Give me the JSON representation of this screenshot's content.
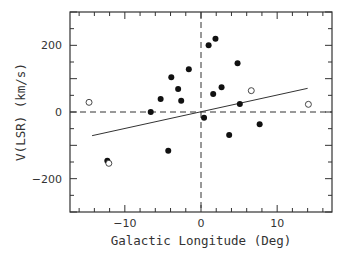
{
  "chart_data": {
    "type": "scatter",
    "title": "",
    "xlabel": "Galactic Longitude (Deg)",
    "ylabel": "V(LSR) (km/s)",
    "xlim": [
      -17.2,
      17.2
    ],
    "ylim": [
      -300,
      300
    ],
    "xticks_major": [
      -10,
      0,
      10
    ],
    "xtick_labels": [
      "−10",
      "0",
      "10"
    ],
    "xticks_minor_step": 2,
    "yticks_major": [
      -200,
      0,
      200
    ],
    "ytick_labels": [
      "−200",
      "0",
      "200"
    ],
    "yticks_minor_step": 50,
    "grid": false,
    "reference_lines": [
      {
        "orientation": "horizontal",
        "value": 0,
        "style": "dashed"
      },
      {
        "orientation": "vertical",
        "value": 0,
        "style": "dashed"
      }
    ],
    "series": [
      {
        "name": "filled",
        "marker": "filled-circle",
        "x": [
          1.0,
          1.9,
          4.8,
          -1.6,
          -3.9,
          -3.0,
          -5.3,
          -2.6,
          -6.6,
          1.6,
          2.7,
          5.1,
          0.4,
          7.7,
          3.7,
          -4.3,
          -12.3
        ],
        "y": [
          200,
          220,
          146,
          128,
          104,
          69,
          39,
          34,
          0,
          54,
          74,
          24,
          -17,
          -37,
          -69,
          -116,
          -146
        ]
      },
      {
        "name": "open",
        "marker": "open-circle",
        "x": [
          -14.7,
          6.6,
          14.1,
          -12.1
        ],
        "y": [
          29,
          64,
          23,
          -154
        ]
      },
      {
        "name": "fit",
        "type": "line",
        "x": [
          -14.3,
          14.0
        ],
        "y": [
          -71,
          71
        ]
      }
    ]
  }
}
